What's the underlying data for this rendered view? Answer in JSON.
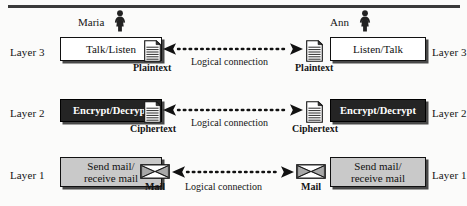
{
  "diagram": {
    "top_rule": true,
    "colors": {
      "dark_box": "#242424",
      "gray_box": "#c9c9c9",
      "white_box": "#ffffff",
      "stroke": "#111111",
      "shadow": "#282828"
    },
    "people": [
      {
        "name": "Maria",
        "icon": "person-female-icon",
        "side": "left"
      },
      {
        "name": "Ann",
        "icon": "person-female-icon",
        "side": "right"
      }
    ],
    "layers": [
      {
        "id": "layer3",
        "label_left": "Layer 3",
        "label_right": "Layer 3",
        "box_left": "Talk/Listen",
        "box_right": "Listen/Talk",
        "box_style": "white",
        "artifact_left": "Plaintext",
        "artifact_right": "Plaintext",
        "artifact_icon": "document-icon",
        "connection_label": "Logical connection"
      },
      {
        "id": "layer2",
        "label_left": "Layer 2",
        "label_right": "Layer 2",
        "box_left": "Encrypt/Decrypt",
        "box_right": "Encrypt/Decrypt",
        "box_style": "dark",
        "artifact_left": "Ciphertext",
        "artifact_right": "Ciphertext",
        "artifact_icon": "document-icon",
        "connection_label": "Logical connection"
      },
      {
        "id": "layer1",
        "label_left": "Layer 1",
        "label_right": "Layer 1",
        "box_left": "Send mail/\nreceive mail",
        "box_right": "Send mail/\nreceive mail",
        "box_style": "gray",
        "artifact_left": "Mail",
        "artifact_right": "Mail",
        "artifact_icon": "envelope-icon",
        "connection_label": "Logical connection"
      }
    ]
  }
}
